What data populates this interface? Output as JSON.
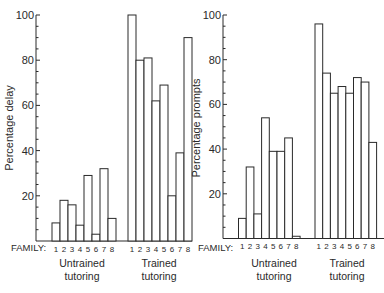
{
  "chart_data": [
    {
      "type": "bar",
      "title": "",
      "xlabel": "FAMILY:",
      "ylabel": "Percentage delay",
      "ylim": [
        0,
        100
      ],
      "yticks": [
        20,
        40,
        60,
        80,
        100
      ],
      "minor_tick_step": 5,
      "grid": false,
      "categories": [
        "1",
        "2",
        "3",
        "4",
        "5",
        "6",
        "7",
        "8"
      ],
      "series": [
        {
          "name": "Untrained tutoring",
          "values": [
            8,
            18,
            16,
            7,
            29,
            3,
            32,
            10
          ]
        },
        {
          "name": "Trained tutoring",
          "values": [
            100,
            80,
            81,
            62,
            69,
            20,
            39,
            90
          ]
        }
      ]
    },
    {
      "type": "bar",
      "title": "",
      "xlabel": "FAMILY:",
      "ylabel": "Percentage prompts",
      "ylim": [
        0,
        100
      ],
      "yticks": [
        20,
        40,
        60,
        80,
        100
      ],
      "minor_tick_step": 5,
      "grid": false,
      "categories": [
        "1",
        "2",
        "3",
        "4",
        "5",
        "6",
        "7",
        "8"
      ],
      "series": [
        {
          "name": "Untrained tutoring",
          "values": [
            9,
            32,
            11,
            54,
            39,
            39,
            45,
            1
          ]
        },
        {
          "name": "Trained tutoring",
          "values": [
            96,
            74,
            65,
            68,
            65,
            72,
            70,
            43
          ]
        }
      ]
    }
  ],
  "labels": {
    "family": "FAMILY:",
    "left_ylabel": "Percentage delay",
    "right_ylabel": "Percentage prompts",
    "untrained_line1": "Untrained",
    "untrained_line2": "tutoring",
    "trained_line1": "Trained",
    "trained_line2": "tutoring"
  }
}
